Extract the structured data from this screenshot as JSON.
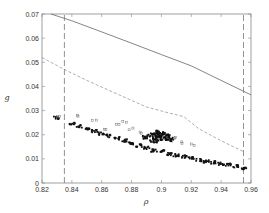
{
  "chart_data": {
    "type": "scatter",
    "title": "",
    "xlabel": "ρ",
    "ylabel": "g",
    "xlim": [
      0.82,
      0.96
    ],
    "ylim": [
      0,
      0.07
    ],
    "xticks": [
      0.82,
      0.84,
      0.86,
      0.88,
      0.9,
      0.92,
      0.94,
      0.96
    ],
    "xtick_labels": [
      "0.82",
      "0.84",
      "0.86",
      "0.88",
      "0.9",
      "0.92",
      "0.94",
      "0.96"
    ],
    "yticks": [
      0,
      0.01,
      0.02,
      0.03,
      0.04,
      0.05,
      0.06,
      0.07
    ],
    "ytick_labels": [
      "0",
      "0.01",
      "0.02",
      "0.03",
      "0.04",
      "0.05",
      "0.06",
      "0.07"
    ],
    "grid": false,
    "legend": null,
    "series": [
      {
        "name": "upper bound (solid)",
        "style": "solid-line",
        "x": [
          0.826,
          0.84,
          0.86,
          0.88,
          0.9,
          0.92,
          0.94,
          0.96
        ],
        "y": [
          0.07,
          0.0672,
          0.0626,
          0.0579,
          0.0532,
          0.0485,
          0.0425,
          0.0365
        ]
      },
      {
        "name": "dashed curve",
        "style": "dashed-line",
        "x": [
          0.82,
          0.835,
          0.85,
          0.87,
          0.89,
          0.905,
          0.915,
          0.925,
          0.94,
          0.955
        ],
        "y": [
          0.052,
          0.047,
          0.0425,
          0.037,
          0.0315,
          0.029,
          0.0275,
          0.0225,
          0.0175,
          0.013
        ]
      },
      {
        "name": "vertical bound left",
        "style": "dashed-vertical",
        "x": [
          0.835,
          0.835
        ],
        "y": [
          0,
          0.07
        ]
      },
      {
        "name": "vertical bound right",
        "style": "dashed-vertical",
        "x": [
          0.955,
          0.955
        ],
        "y": [
          0,
          0.07
        ]
      },
      {
        "name": "simulation points (dense band)",
        "style": "scatter-dark",
        "x": [
          0.83,
          0.84,
          0.845,
          0.85,
          0.855,
          0.86,
          0.865,
          0.87,
          0.875,
          0.88,
          0.885,
          0.89,
          0.895,
          0.9,
          0.905,
          0.91,
          0.915,
          0.92,
          0.925,
          0.93,
          0.935,
          0.94,
          0.945,
          0.95,
          0.955
        ],
        "y": [
          0.027,
          0.0245,
          0.0235,
          0.0225,
          0.0215,
          0.0205,
          0.0195,
          0.0185,
          0.0175,
          0.0165,
          0.0155,
          0.0145,
          0.0135,
          0.013,
          0.012,
          0.0115,
          0.011,
          0.0105,
          0.0095,
          0.009,
          0.0085,
          0.008,
          0.0075,
          0.007,
          0.006
        ]
      },
      {
        "name": "simulation points (cluster)",
        "style": "scatter-cluster",
        "x": [
          0.89,
          0.893,
          0.896,
          0.899,
          0.902,
          0.905,
          0.895,
          0.9,
          0.903,
          0.897
        ],
        "y": [
          0.019,
          0.02,
          0.021,
          0.0195,
          0.0185,
          0.018,
          0.0175,
          0.0205,
          0.0195,
          0.0185
        ]
      },
      {
        "name": "simulation points (sparse outliers)",
        "style": "scatter-light",
        "x": [
          0.832,
          0.845,
          0.855,
          0.862,
          0.872,
          0.876,
          0.88,
          0.885,
          0.91,
          0.915,
          0.92
        ],
        "y": [
          0.028,
          0.0275,
          0.026,
          0.0225,
          0.0245,
          0.025,
          0.0225,
          0.021,
          0.019,
          0.017,
          0.016
        ]
      }
    ]
  },
  "plot_area": {
    "left_px": 42,
    "top_px": 14,
    "right_px": 251,
    "bottom_px": 183
  },
  "colors": {
    "axis": "#888888",
    "solid_line": "#666666",
    "dashed_line": "#999999",
    "vertical_dashed": "#777777",
    "points_dark": "#111111",
    "points_light": "#777777",
    "text": "#333333"
  }
}
